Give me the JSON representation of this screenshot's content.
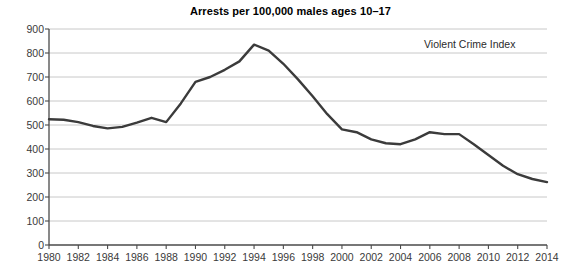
{
  "chart_data": {
    "type": "line",
    "title": "Arrests per 100,000 males ages 10–17",
    "xlabel": "",
    "ylabel": "",
    "xlim": [
      1980,
      2014
    ],
    "ylim": [
      0,
      900
    ],
    "grid": "horizontal",
    "legend_position": "inside-top-right",
    "annotations": [
      "Violent Crime Index"
    ],
    "xticks": [
      1980,
      1982,
      1984,
      1986,
      1988,
      1990,
      1992,
      1994,
      1996,
      1998,
      2000,
      2002,
      2004,
      2006,
      2008,
      2010,
      2012,
      2014
    ],
    "xtick_labels": [
      "1980",
      "1982",
      "1984",
      "1986",
      "1988",
      "1990",
      "1992",
      "1994",
      "1996",
      "1998",
      "2000",
      "2002",
      "2004",
      "2006",
      "2008",
      "2010",
      "2012",
      "2014"
    ],
    "yticks": [
      0,
      100,
      200,
      300,
      400,
      500,
      600,
      700,
      800,
      900
    ],
    "ytick_labels": [
      "0",
      "100",
      "200",
      "300",
      "400",
      "500",
      "600",
      "700",
      "800",
      "900"
    ],
    "series": [
      {
        "name": "Violent Crime Index",
        "color": "#3b3b3b",
        "x": [
          1980,
          1981,
          1982,
          1983,
          1984,
          1985,
          1986,
          1987,
          1988,
          1989,
          1990,
          1991,
          1992,
          1993,
          1994,
          1995,
          1996,
          1997,
          1998,
          1999,
          2000,
          2001,
          2002,
          2003,
          2004,
          2005,
          2006,
          2007,
          2008,
          2009,
          2010,
          2011,
          2012,
          2013,
          2014
        ],
        "values": [
          524,
          522,
          512,
          496,
          486,
          492,
          510,
          530,
          512,
          590,
          680,
          700,
          730,
          765,
          835,
          810,
          755,
          690,
          620,
          545,
          482,
          470,
          440,
          424,
          420,
          440,
          470,
          462,
          462,
          420,
          375,
          330,
          295,
          275,
          262
        ]
      }
    ]
  },
  "axis_style": {
    "grid_color": "#c8c8c8",
    "axis_color": "#4a4a4a",
    "tick_color": "#4a4a4a",
    "line_color": "#3b3b3b",
    "line_width": 2.4
  }
}
